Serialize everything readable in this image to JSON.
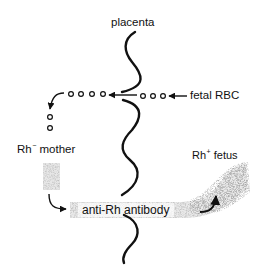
{
  "diagram": {
    "labels": {
      "placenta": "placenta",
      "fetal_rbc": "fetal RBC",
      "mother_base": "Rh",
      "mother_sign": "−",
      "mother_word": "mother",
      "fetus_base": "Rh",
      "fetus_sign": "+",
      "fetus_word": "fetus",
      "antibody": "anti-Rh antibody"
    },
    "nodes": [
      {
        "id": "placenta",
        "label": "placenta",
        "shape": "wavy-vertical-line"
      },
      {
        "id": "fetal-rbc",
        "label": "fetal RBC",
        "shape": "small-circles"
      },
      {
        "id": "mother",
        "label": "Rh− mother",
        "shape": "stippled-rect"
      },
      {
        "id": "fetus",
        "label": "Rh+ fetus",
        "shape": "stippled-region"
      },
      {
        "id": "antibody",
        "label": "anti-Rh antibody",
        "shape": "stippled-band"
      }
    ],
    "edges": [
      {
        "from": "fetal-rbc",
        "to": "placenta",
        "label": "fetal RBC cross placenta"
      },
      {
        "from": "placenta",
        "to": "mother",
        "label": "RBCs enter maternal circulation"
      },
      {
        "from": "mother",
        "to": "antibody",
        "label": "mother produces antibody"
      },
      {
        "from": "antibody",
        "to": "fetus",
        "label": "antibody crosses to fetus"
      }
    ],
    "colors": {
      "ink": "#111111",
      "stipple": "#9a9a9a",
      "background": "#ffffff"
    }
  }
}
